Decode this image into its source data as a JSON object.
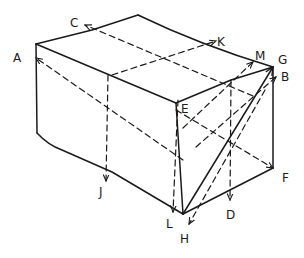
{
  "diagram": {
    "stroke_color": "#1a1a1a",
    "background": "#ffffff",
    "labels": {
      "A": "A",
      "B": "B",
      "C": "C",
      "D": "D",
      "E": "E",
      "F": "F",
      "G": "G",
      "H": "H",
      "J": "J",
      "K": "K",
      "L": "L",
      "M": "M"
    },
    "box_corners": {
      "front_left_top": [
        36,
        44
      ],
      "back_left_top": [
        138,
        15
      ],
      "back_right_top": [
        273,
        67
      ],
      "front_right_top_E": [
        176,
        103
      ],
      "front_left_bottom": [
        37,
        133
      ],
      "front_right_bottom_H": [
        183,
        214
      ],
      "back_right_bottom_F": [
        273,
        168
      ]
    },
    "arrows": [
      {
        "label": "A",
        "style": "dashed",
        "direction": "toward left front edge"
      },
      {
        "label": "C",
        "style": "dashed",
        "direction": "toward back-left top edge"
      },
      {
        "label": "K",
        "style": "dashed",
        "direction": "toward back-right top edge"
      },
      {
        "label": "M",
        "style": "dashed",
        "direction": "toward right top edge"
      },
      {
        "label": "G",
        "style": "solid",
        "direction": "from H to back-right top corner"
      },
      {
        "label": "B",
        "style": "dashed",
        "direction": "toward right face"
      },
      {
        "label": "F",
        "style": "dashed",
        "direction": "toward bottom right corner"
      },
      {
        "label": "D",
        "style": "dashed",
        "direction": "downward"
      },
      {
        "label": "H",
        "style": "dashed",
        "direction": "toward front bottom corner"
      },
      {
        "label": "J",
        "style": "dashed",
        "direction": "downward on front face"
      },
      {
        "label": "L",
        "style": "dashed",
        "direction": "downward near front corner"
      },
      {
        "label": "E",
        "style": "point",
        "direction": "front top right corner"
      }
    ]
  }
}
